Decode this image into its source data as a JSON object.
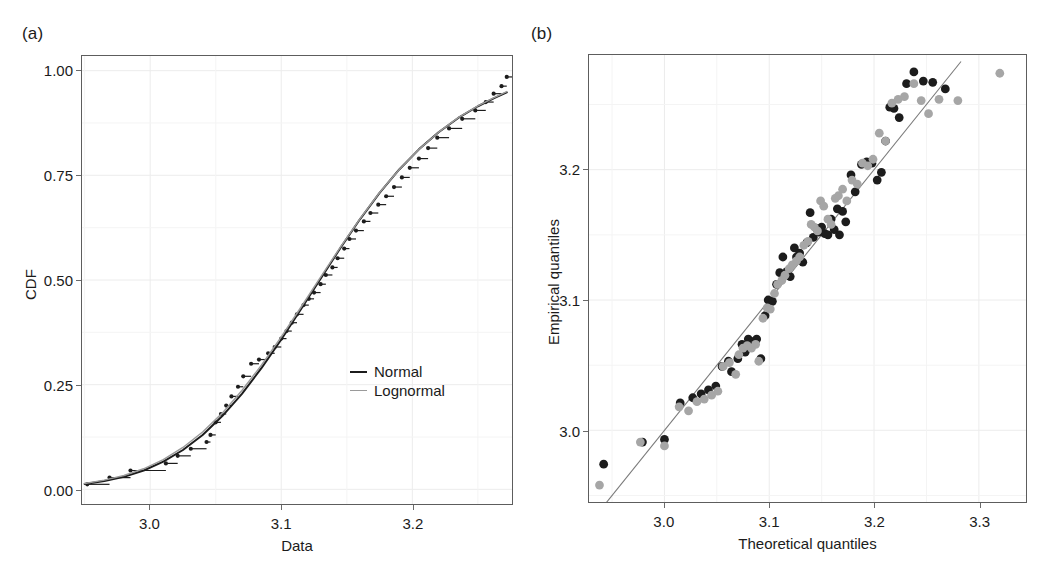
{
  "figure": {
    "panels": [
      {
        "label": "(a)",
        "xlabel": "Data",
        "ylabel": "CDF",
        "xticks": [
          "3.0",
          "3.1",
          "3.2"
        ],
        "yticks": [
          "0.00",
          "0.25",
          "0.50",
          "0.75",
          "1.00"
        ],
        "legend": [
          {
            "name": "Normal",
            "color": "#1c1c1c"
          },
          {
            "name": "Lognormal",
            "color": "#9a9a9a"
          }
        ]
      },
      {
        "label": "(b)",
        "xlabel": "Theoretical quantiles",
        "ylabel": "Empirical quantiles",
        "xticks": [
          "3.0",
          "3.1",
          "3.2",
          "3.3"
        ],
        "yticks": [
          "3.0",
          "3.1",
          "3.2"
        ]
      }
    ]
  },
  "chart_data": [
    {
      "type": "line",
      "id": "panel-a-cdf",
      "title": "",
      "subtitle": "",
      "xlabel": "Data",
      "ylabel": "CDF",
      "xlim": [
        2.948,
        3.276
      ],
      "ylim": [
        -0.035,
        1.035
      ],
      "xticks": [
        3.0,
        3.1,
        3.2
      ],
      "yticks": [
        0.0,
        0.25,
        0.5,
        0.75,
        1.0
      ],
      "grid": true,
      "legend_position": "inside-right-lower",
      "series": [
        {
          "name": "Empirical CDF",
          "kind": "step",
          "marker": "point",
          "color": "#1c1c1c",
          "x": [
            2.952,
            2.969,
            2.985,
            3.012,
            3.021,
            3.031,
            3.043,
            3.046,
            3.05,
            3.054,
            3.058,
            3.062,
            3.067,
            3.071,
            3.077,
            3.083,
            3.09,
            3.095,
            3.1,
            3.104,
            3.108,
            3.112,
            3.117,
            3.121,
            3.125,
            3.13,
            3.134,
            3.139,
            3.143,
            3.148,
            3.152,
            3.157,
            3.163,
            3.168,
            3.174,
            3.18,
            3.186,
            3.192,
            3.198,
            3.205,
            3.212,
            3.219,
            3.228,
            3.238,
            3.248,
            3.256,
            3.262,
            3.268,
            3.272
          ],
          "y": [
            0.012,
            0.028,
            0.045,
            0.062,
            0.08,
            0.097,
            0.113,
            0.13,
            0.16,
            0.18,
            0.2,
            0.222,
            0.245,
            0.27,
            0.3,
            0.31,
            0.325,
            0.34,
            0.36,
            0.378,
            0.398,
            0.418,
            0.44,
            0.455,
            0.47,
            0.49,
            0.512,
            0.53,
            0.552,
            0.575,
            0.598,
            0.618,
            0.64,
            0.66,
            0.68,
            0.7,
            0.722,
            0.745,
            0.768,
            0.79,
            0.815,
            0.84,
            0.862,
            0.885,
            0.905,
            0.925,
            0.945,
            0.963,
            0.985
          ]
        },
        {
          "name": "Normal",
          "kind": "curve",
          "color": "#1c1c1c",
          "x": [
            2.95,
            2.965,
            2.98,
            2.995,
            3.01,
            3.025,
            3.04,
            3.055,
            3.07,
            3.085,
            3.1,
            3.115,
            3.13,
            3.145,
            3.16,
            3.175,
            3.19,
            3.205,
            3.22,
            3.235,
            3.25,
            3.262,
            3.272
          ],
          "y": [
            0.013,
            0.02,
            0.03,
            0.045,
            0.066,
            0.094,
            0.13,
            0.175,
            0.228,
            0.29,
            0.358,
            0.43,
            0.503,
            0.576,
            0.645,
            0.708,
            0.764,
            0.812,
            0.853,
            0.887,
            0.915,
            0.934,
            0.948
          ]
        },
        {
          "name": "Lognormal",
          "kind": "curve",
          "color": "#9a9a9a",
          "x": [
            2.95,
            2.965,
            2.98,
            2.995,
            3.01,
            3.025,
            3.04,
            3.055,
            3.07,
            3.085,
            3.1,
            3.115,
            3.13,
            3.145,
            3.16,
            3.175,
            3.19,
            3.205,
            3.22,
            3.235,
            3.25,
            3.262,
            3.272
          ],
          "y": [
            0.014,
            0.022,
            0.033,
            0.049,
            0.071,
            0.1,
            0.137,
            0.182,
            0.236,
            0.297,
            0.364,
            0.435,
            0.507,
            0.578,
            0.646,
            0.709,
            0.764,
            0.812,
            0.853,
            0.888,
            0.916,
            0.935,
            0.95
          ]
        }
      ]
    },
    {
      "type": "scatter",
      "id": "panel-b-qq",
      "title": "",
      "subtitle": "",
      "xlabel": "Theoretical quantiles",
      "ylabel": "Empirical quantiles",
      "xlim": [
        2.928,
        3.345
      ],
      "ylim": [
        2.945,
        3.288
      ],
      "xticks": [
        3.0,
        3.1,
        3.2,
        3.3
      ],
      "yticks": [
        3.0,
        3.1,
        3.2
      ],
      "grid": true,
      "reference_line": {
        "name": "y = x",
        "color": "#7a7a7a",
        "from": [
          2.938,
          2.938
        ],
        "to": [
          3.283,
          3.283
        ]
      },
      "series": [
        {
          "name": "Normal",
          "color": "#1c1c1c",
          "points": [
            [
              2.942,
              2.974
            ],
            [
              2.979,
              2.991
            ],
            [
              3.0,
              2.993
            ],
            [
              3.015,
              3.021
            ],
            [
              3.027,
              3.025
            ],
            [
              3.035,
              3.028
            ],
            [
              3.042,
              3.031
            ],
            [
              3.049,
              3.034
            ],
            [
              3.055,
              3.049
            ],
            [
              3.061,
              3.053
            ],
            [
              3.064,
              3.045
            ],
            [
              3.07,
              3.055
            ],
            [
              3.074,
              3.066
            ],
            [
              3.077,
              3.06
            ],
            [
              3.08,
              3.07
            ],
            [
              3.084,
              3.068
            ],
            [
              3.088,
              3.07
            ],
            [
              3.092,
              3.055
            ],
            [
              3.096,
              3.088
            ],
            [
              3.099,
              3.1
            ],
            [
              3.103,
              3.099
            ],
            [
              3.107,
              3.112
            ],
            [
              3.11,
              3.121
            ],
            [
              3.113,
              3.133
            ],
            [
              3.117,
              3.122
            ],
            [
              3.12,
              3.118
            ],
            [
              3.124,
              3.14
            ],
            [
              3.126,
              3.133
            ],
            [
              3.129,
              3.136
            ],
            [
              3.132,
              3.129
            ],
            [
              3.136,
              3.144
            ],
            [
              3.139,
              3.167
            ],
            [
              3.142,
              3.148
            ],
            [
              3.145,
              3.155
            ],
            [
              3.147,
              3.152
            ],
            [
              3.15,
              3.156
            ],
            [
              3.153,
              3.151
            ],
            [
              3.156,
              3.15
            ],
            [
              3.159,
              3.162
            ],
            [
              3.162,
              3.154
            ],
            [
              3.165,
              3.17
            ],
            [
              3.167,
              3.15
            ],
            [
              3.17,
              3.168
            ],
            [
              3.173,
              3.16
            ],
            [
              3.178,
              3.196
            ],
            [
              3.182,
              3.183
            ],
            [
              3.188,
              3.204
            ],
            [
              3.193,
              3.206
            ],
            [
              3.198,
              3.205
            ],
            [
              3.203,
              3.192
            ],
            [
              3.207,
              3.198
            ],
            [
              3.211,
              3.222
            ],
            [
              3.215,
              3.248
            ],
            [
              3.219,
              3.247
            ],
            [
              3.224,
              3.24
            ],
            [
              3.231,
              3.266
            ],
            [
              3.238,
              3.275
            ],
            [
              3.247,
              3.268
            ],
            [
              3.256,
              3.267
            ],
            [
              3.268,
              3.262
            ]
          ]
        },
        {
          "name": "Lognormal",
          "color": "#a6a6a6",
          "points": [
            [
              2.938,
              2.958
            ],
            [
              2.977,
              2.991
            ],
            [
              3.0,
              2.988
            ],
            [
              3.014,
              3.018
            ],
            [
              3.023,
              3.015
            ],
            [
              3.031,
              3.022
            ],
            [
              3.038,
              3.024
            ],
            [
              3.045,
              3.027
            ],
            [
              3.051,
              3.03
            ],
            [
              3.056,
              3.049
            ],
            [
              3.062,
              3.052
            ],
            [
              3.068,
              3.043
            ],
            [
              3.071,
              3.058
            ],
            [
              3.075,
              3.063
            ],
            [
              3.079,
              3.065
            ],
            [
              3.083,
              3.063
            ],
            [
              3.087,
              3.066
            ],
            [
              3.09,
              3.053
            ],
            [
              3.094,
              3.086
            ],
            [
              3.098,
              3.094
            ],
            [
              3.101,
              3.093
            ],
            [
              3.105,
              3.105
            ],
            [
              3.108,
              3.112
            ],
            [
              3.112,
              3.115
            ],
            [
              3.115,
              3.119
            ],
            [
              3.119,
              3.124
            ],
            [
              3.122,
              3.127
            ],
            [
              3.126,
              3.13
            ],
            [
              3.129,
              3.133
            ],
            [
              3.133,
              3.142
            ],
            [
              3.137,
              3.145
            ],
            [
              3.14,
              3.158
            ],
            [
              3.143,
              3.156
            ],
            [
              3.146,
              3.153
            ],
            [
              3.149,
              3.176
            ],
            [
              3.152,
              3.172
            ],
            [
              3.156,
              3.162
            ],
            [
              3.159,
              3.158
            ],
            [
              3.163,
              3.178
            ],
            [
              3.166,
              3.18
            ],
            [
              3.17,
              3.185
            ],
            [
              3.174,
              3.176
            ],
            [
              3.179,
              3.192
            ],
            [
              3.184,
              3.189
            ],
            [
              3.189,
              3.205
            ],
            [
              3.194,
              3.203
            ],
            [
              3.199,
              3.208
            ],
            [
              3.205,
              3.228
            ],
            [
              3.211,
              3.222
            ],
            [
              3.217,
              3.251
            ],
            [
              3.223,
              3.254
            ],
            [
              3.229,
              3.256
            ],
            [
              3.238,
              3.266
            ],
            [
              3.245,
              3.253
            ],
            [
              3.252,
              3.243
            ],
            [
              3.262,
              3.254
            ],
            [
              3.28,
              3.253
            ],
            [
              3.32,
              3.274
            ]
          ]
        }
      ]
    }
  ]
}
